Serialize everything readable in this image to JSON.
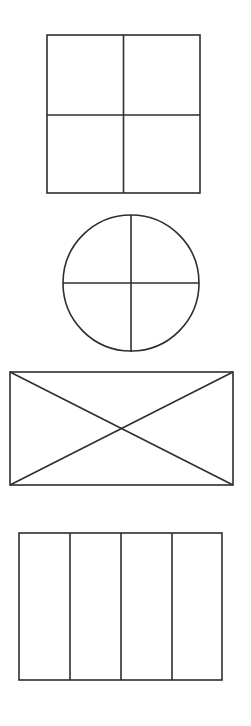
{
  "diagram": {
    "title": "",
    "stroke_color": "#2e2e2e",
    "background_color": "#ffffff",
    "shapes": [
      {
        "id": "square-quarters",
        "kind": "square",
        "division": "quarters",
        "parts": 4,
        "divider_orientation": "vertical-and-horizontal"
      },
      {
        "id": "circle-quarters",
        "kind": "circle",
        "division": "quarters",
        "parts": 4,
        "divider_orientation": "vertical-and-horizontal"
      },
      {
        "id": "rectangle-diagonals",
        "kind": "rectangle",
        "division": "diagonals",
        "parts": 4,
        "divider_orientation": "diagonal"
      },
      {
        "id": "rectangle-vertical-strips",
        "kind": "rectangle",
        "division": "vertical-strips",
        "parts": 4,
        "divider_orientation": "vertical"
      }
    ]
  }
}
